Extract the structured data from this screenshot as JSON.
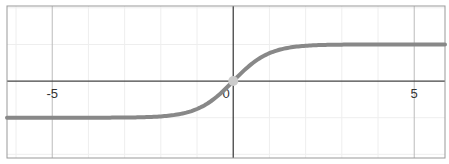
{
  "chart_data": {
    "type": "line",
    "title": "",
    "xlabel": "",
    "ylabel": "",
    "function": "tanh(x)",
    "xlim": [
      -6.25,
      5.85
    ],
    "ylim": [
      -2.1,
      2.05
    ],
    "grid": true,
    "legend": null,
    "x_tick_labels": [
      "-5",
      "0",
      "5"
    ],
    "x_ticks": [
      -5,
      0,
      5
    ],
    "series": [
      {
        "name": "curve",
        "color": "#888888",
        "x": [
          -6,
          -5,
          -4,
          -3,
          -2,
          -1.5,
          -1,
          -0.5,
          0,
          0.5,
          1,
          1.5,
          2,
          3,
          4,
          5,
          6
        ],
        "y": [
          -1.0,
          -0.9999,
          -0.9993,
          -0.9951,
          -0.964,
          -0.9051,
          -0.7616,
          -0.4621,
          0,
          0.4621,
          0.7616,
          0.9051,
          0.964,
          0.9951,
          0.9993,
          0.9999,
          1.0
        ]
      }
    ],
    "highlighted_point": {
      "x": 0,
      "y": 0
    },
    "colors": {
      "axis": "#444444",
      "major_grid": "#bbbbbb",
      "minor_grid": "#eeeeee",
      "frame": "#999999",
      "curve": "#888888",
      "point": "#cccccc"
    }
  }
}
